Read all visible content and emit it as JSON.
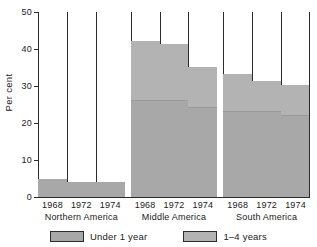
{
  "chart_data": {
    "type": "bar",
    "stacked": true,
    "title": "",
    "subtitle": "",
    "xlabel": "",
    "ylabel": "Per cent",
    "ylim": [
      0,
      50
    ],
    "yticks": [
      0,
      10,
      20,
      30,
      40,
      50
    ],
    "ytick_labels": [
      "0",
      "10",
      "20",
      "30",
      "40",
      "50"
    ],
    "grid": false,
    "legend_position": "bottom",
    "groups": [
      "Northern America",
      "Middle America",
      "South America"
    ],
    "categories": [
      "1968",
      "1972",
      "1974",
      "1968",
      "1972",
      "1974",
      "1968",
      "1972",
      "1974"
    ],
    "series": [
      {
        "name": "Under 1 year",
        "color": "#a8a8a8",
        "values": [
          5,
          4,
          4,
          26,
          26,
          24,
          23,
          23,
          22
        ]
      },
      {
        "name": "1–4 years",
        "color": "#b3b3b3",
        "values": [
          0,
          0,
          0,
          16,
          15,
          11,
          10,
          8,
          8
        ]
      }
    ],
    "totals": [
      5,
      4,
      4,
      42,
      41,
      35,
      33,
      31,
      30
    ]
  },
  "axis": {
    "y_label": "Per cent",
    "y_ticks": [
      "50",
      "40",
      "30",
      "20",
      "10",
      "0"
    ]
  },
  "x_axis": {
    "groups": [
      {
        "name": "Northern America",
        "years": [
          "1968",
          "1972",
          "1974"
        ]
      },
      {
        "name": "Middle America",
        "years": [
          "1968",
          "1972",
          "1974"
        ]
      },
      {
        "name": "South America",
        "years": [
          "1968",
          "1972",
          "1974"
        ]
      }
    ]
  },
  "legend": {
    "items": [
      {
        "label": "Under 1 year",
        "color": "#a8a8a8"
      },
      {
        "label": "1–4 years",
        "color": "#b3b3b3"
      }
    ]
  }
}
